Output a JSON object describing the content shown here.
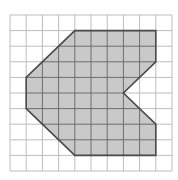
{
  "grid": {
    "cols": 10,
    "rows": 10,
    "origin_x": 10,
    "origin_y": 15,
    "width": 162,
    "height": 156,
    "line_color": "#bdbdbd",
    "inner_line_color": "#6e6e6e"
  },
  "shape": {
    "name": "concave-octagon-with-notch",
    "vertices": [
      [
        4,
        1
      ],
      [
        9,
        1
      ],
      [
        9,
        3
      ],
      [
        7,
        5
      ],
      [
        9,
        7
      ],
      [
        9,
        9
      ],
      [
        4,
        9
      ],
      [
        1,
        6
      ],
      [
        1,
        4
      ]
    ],
    "fill_color": "#c9c9c9",
    "stroke_color": "#4a4a4a"
  }
}
